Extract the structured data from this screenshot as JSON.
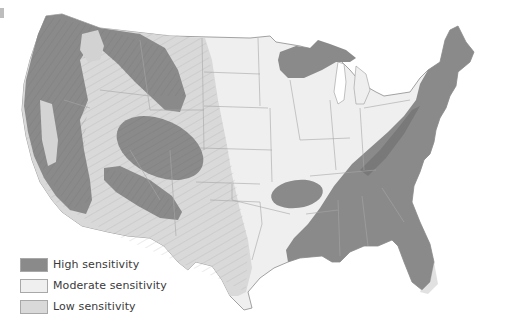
{
  "map": {
    "subject": "Contiguous United States",
    "colors": {
      "high": "#8a8a8a",
      "moderate": "#efefef",
      "low": "#d9d9d9",
      "border": "#9a9a9a",
      "background": "#ffffff"
    }
  },
  "legend": {
    "items": [
      {
        "label": "High sensitivity",
        "color": "#8a8a8a"
      },
      {
        "label": "Moderate sensitivity",
        "color": "#efefef"
      },
      {
        "label": "Low sensitivity",
        "color": "#d9d9d9"
      }
    ]
  }
}
